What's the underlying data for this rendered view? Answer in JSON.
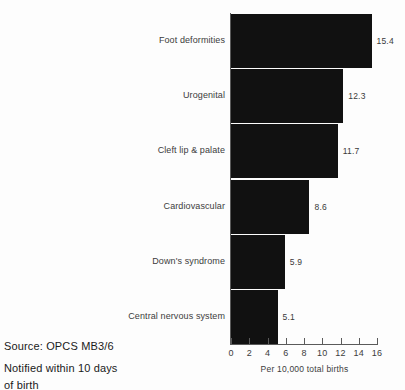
{
  "chart_data": {
    "type": "bar",
    "orientation": "horizontal",
    "title": "",
    "subtitle": "",
    "xlabel": "Per 10,000 total births",
    "ylabel": "",
    "xlim": [
      0,
      16
    ],
    "xticks": [
      "0",
      "2",
      "4",
      "6",
      "8",
      "10",
      "12",
      "14",
      "16"
    ],
    "grid": false,
    "legend": false,
    "bar_color": "#111111",
    "categories": [
      "Foot deformities",
      "Urogenital",
      "Cleft lip & palate",
      "Cardiovascular",
      "Down's syndrome",
      "Central nervous system"
    ],
    "values": [
      15.4,
      12.3,
      11.7,
      8.6,
      5.9,
      5.1
    ],
    "value_labels": [
      "15.4",
      "12.3",
      "11.7",
      "8.6",
      "5.9",
      "5.1"
    ]
  },
  "notes": {
    "source": "Source: OPCS MB3/6",
    "footnote_line1": "Notified within 10 days",
    "footnote_line2": "of birth"
  }
}
